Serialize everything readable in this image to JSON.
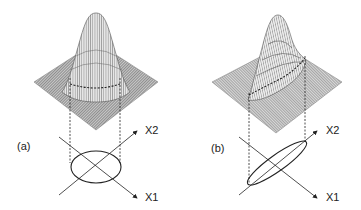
{
  "figure": {
    "panels": [
      {
        "id": "a",
        "label": "(a)",
        "description": "Bivariate Gaussian surface with uncorrelated variables; circular/elliptic contour aligned with axes",
        "axes": {
          "x1_label": "X1",
          "x2_label": "X2"
        }
      },
      {
        "id": "b",
        "label": "(b)",
        "description": "Bivariate Gaussian surface with correlated variables; elongated tilted elliptic contour",
        "axes": {
          "x1_label": "X1",
          "x2_label": "X2"
        }
      }
    ],
    "colors": {
      "mesh": "#555555",
      "base": "#8a8a8a",
      "line": "#222222"
    }
  }
}
